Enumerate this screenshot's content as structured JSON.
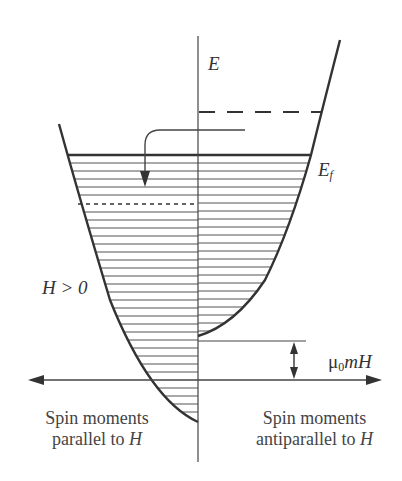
{
  "diagram": {
    "type": "spin-split density of states (Pauli paramagnetism)",
    "labels": {
      "energy_axis": "E",
      "fermi_level": "E",
      "fermi_level_sub": "f",
      "field_condition": "H > 0",
      "zeeman_shift_prefix": "μ",
      "zeeman_shift_sub": "0",
      "zeeman_shift_suffix": "mH"
    },
    "captions": {
      "left_line1": "Spin moments",
      "left_line2_prefix": "parallel to ",
      "left_line2_var": "H",
      "right_line1": "Spin moments",
      "right_line2_prefix": "antiparallel to ",
      "right_line2_var": "H"
    },
    "colors": {
      "line": "#333333",
      "hatch": "#555555",
      "background": "#ffffff"
    }
  }
}
